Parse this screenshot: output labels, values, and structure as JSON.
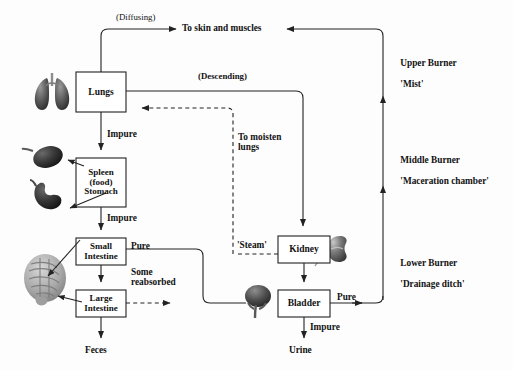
{
  "diagram": {
    "boxes": [
      {
        "id": "lungs",
        "label": "Lungs"
      },
      {
        "id": "spleen_stomach",
        "label": "Spleen\n(food)\nStomach"
      },
      {
        "id": "small_intestine",
        "label": "Small\nIntestine"
      },
      {
        "id": "large_intestine",
        "label": "Large\nIntestine"
      },
      {
        "id": "kidney",
        "label": "Kidney"
      },
      {
        "id": "bladder",
        "label": "Bladder"
      }
    ],
    "edge_labels": [
      {
        "id": "diffusing",
        "text": "(Diffusing)"
      },
      {
        "id": "to_skin_muscles",
        "text": "To skin and muscles"
      },
      {
        "id": "descending",
        "text": "(Descending)"
      },
      {
        "id": "impure_lungs",
        "text": "Impure"
      },
      {
        "id": "impure_stomach",
        "text": "Impure"
      },
      {
        "id": "to_moisten_lungs",
        "text": "To moisten\nlungs"
      },
      {
        "id": "steam",
        "text": "'Steam'"
      },
      {
        "id": "pure_small_int",
        "text": "Pure"
      },
      {
        "id": "some_reabsorbed",
        "text": "Some\nreabsorbed"
      },
      {
        "id": "pure_bladder",
        "text": "Pure"
      },
      {
        "id": "impure_bladder",
        "text": "Impure"
      },
      {
        "id": "feces",
        "text": "Feces"
      },
      {
        "id": "urine",
        "text": "Urine"
      }
    ],
    "burners": [
      {
        "id": "upper_burner",
        "name": "Upper Burner",
        "nickname": "'Mist'"
      },
      {
        "id": "middle_burner",
        "name": "Middle Burner",
        "nickname": "'Maceration chamber'"
      },
      {
        "id": "lower_burner",
        "name": "Lower Burner",
        "nickname": "'Drainage ditch'"
      }
    ],
    "organ_images": [
      {
        "id": "lungs-illustration",
        "alt": "lungs"
      },
      {
        "id": "spleen-illustration",
        "alt": "spleen"
      },
      {
        "id": "stomach-illustration",
        "alt": "stomach"
      },
      {
        "id": "intestines-illustration",
        "alt": "intestines"
      },
      {
        "id": "kidney-illustration",
        "alt": "kidney"
      },
      {
        "id": "bladder-illustration",
        "alt": "bladder"
      }
    ],
    "colors": {
      "stroke": "#222222",
      "text": "#111111",
      "background": "#fdfdfd",
      "organ_dark": "#3a3a3a",
      "organ_mid": "#6f6f6f",
      "organ_light": "#b3b3b3"
    }
  }
}
